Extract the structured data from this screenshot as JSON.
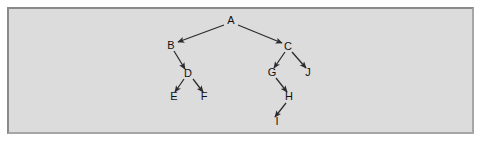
{
  "figure": {
    "background_color": "#dcdcdc",
    "border_color": "#8a8a8a",
    "page_color": "#ffffff",
    "edge_color": "#2b2b2b",
    "label_color": "#111111"
  },
  "graph": {
    "type": "directed-tree",
    "nodes": [
      {
        "id": "A",
        "label": "A",
        "x": 231,
        "y": 21
      },
      {
        "id": "B",
        "label": "B",
        "x": 171,
        "y": 46
      },
      {
        "id": "C",
        "label": "C",
        "x": 288,
        "y": 47
      },
      {
        "id": "D",
        "label": "D",
        "x": 188,
        "y": 74
      },
      {
        "id": "E",
        "label": "E",
        "x": 174,
        "y": 97
      },
      {
        "id": "F",
        "label": "F",
        "x": 204,
        "y": 97
      },
      {
        "id": "G",
        "label": "G",
        "x": 272,
        "y": 73
      },
      {
        "id": "J",
        "label": "J",
        "x": 308,
        "y": 73
      },
      {
        "id": "H",
        "label": "H",
        "x": 289,
        "y": 97
      },
      {
        "id": "I",
        "label": "I",
        "x": 277,
        "y": 122
      }
    ],
    "edges": [
      {
        "from": "A",
        "to": "B",
        "x1": 224,
        "y1": 25,
        "x2": 178,
        "y2": 42
      },
      {
        "from": "A",
        "to": "C",
        "x1": 238,
        "y1": 25,
        "x2": 282,
        "y2": 43
      },
      {
        "from": "B",
        "to": "D",
        "x1": 174,
        "y1": 51,
        "x2": 185,
        "y2": 69
      },
      {
        "from": "D",
        "to": "E",
        "x1": 184,
        "y1": 79,
        "x2": 175,
        "y2": 92
      },
      {
        "from": "D",
        "to": "F",
        "x1": 193,
        "y1": 79,
        "x2": 203,
        "y2": 92
      },
      {
        "from": "C",
        "to": "G",
        "x1": 285,
        "y1": 52,
        "x2": 274,
        "y2": 68
      },
      {
        "from": "C",
        "to": "J",
        "x1": 292,
        "y1": 52,
        "x2": 306,
        "y2": 68
      },
      {
        "from": "G",
        "to": "H",
        "x1": 276,
        "y1": 78,
        "x2": 287,
        "y2": 92
      },
      {
        "from": "H",
        "to": "I",
        "x1": 286,
        "y1": 103,
        "x2": 275,
        "y2": 117
      }
    ]
  }
}
